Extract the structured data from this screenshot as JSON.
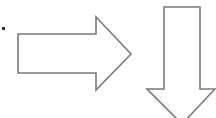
{
  "diagram": {
    "stroke_color": "#7a7a7a",
    "fill_color": "#ffffff",
    "bullet_color": "#333333",
    "shapes": [
      {
        "id": "bullet",
        "type": "square-bullet"
      },
      {
        "id": "right-arrow",
        "type": "block-arrow",
        "direction": "right"
      },
      {
        "id": "down-arrow",
        "type": "block-arrow",
        "direction": "down"
      }
    ]
  }
}
